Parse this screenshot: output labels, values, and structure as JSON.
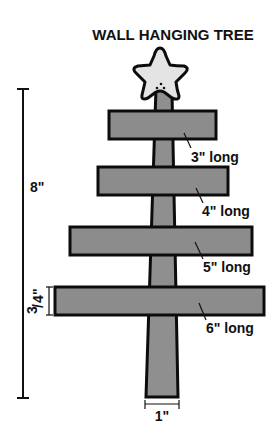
{
  "title": "WALL HANGING TREE",
  "dimensions": {
    "height_label": "8\"",
    "board_thickness_label_num": "3",
    "board_thickness_label_den": "4",
    "board_thickness_label_mark": "\"",
    "trunk_width_label": "1\""
  },
  "boards": [
    {
      "label": "3\" long"
    },
    {
      "label": "4\" long"
    },
    {
      "label": "5\" long"
    },
    {
      "label": "6\" long"
    }
  ],
  "colors": {
    "wood": "#8c8c8c",
    "star": "#e4e4e4",
    "outline": "#0c0c0c"
  },
  "icons": {
    "topper": "star-icon"
  }
}
